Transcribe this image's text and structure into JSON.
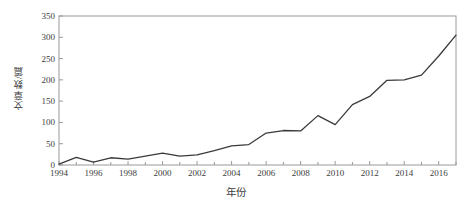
{
  "chart_data": {
    "type": "line",
    "title": "",
    "xlabel": "年份",
    "ylabel": "文章数/篇",
    "x": [
      1994,
      1995,
      1996,
      1997,
      1998,
      1999,
      2000,
      2001,
      2002,
      2003,
      2004,
      2005,
      2006,
      2007,
      2008,
      2009,
      2010,
      2011,
      2012,
      2013,
      2014,
      2015,
      2016,
      2017
    ],
    "values": [
      2,
      18,
      7,
      17,
      14,
      21,
      28,
      21,
      24,
      34,
      45,
      48,
      75,
      81,
      80,
      116,
      95,
      142,
      161,
      199,
      200,
      211,
      256,
      305
    ],
    "series": [
      {
        "name": "文章数",
        "values": [
          2,
          18,
          7,
          17,
          14,
          21,
          28,
          21,
          24,
          34,
          45,
          48,
          75,
          81,
          80,
          116,
          95,
          142,
          161,
          199,
          200,
          211,
          256,
          305
        ]
      }
    ],
    "xlim": [
      1994,
      2017
    ],
    "ylim": [
      0,
      350
    ],
    "yticks": [
      0,
      50,
      100,
      150,
      200,
      250,
      300,
      350
    ],
    "ytick_labels": [
      "0",
      "50",
      "100",
      "150",
      "200",
      "250",
      "300",
      "350"
    ],
    "xticks": [
      1994,
      1996,
      1998,
      2000,
      2002,
      2004,
      2006,
      2008,
      2010,
      2012,
      2014,
      2016
    ],
    "xtick_labels": [
      "1994",
      "1996",
      "1998",
      "2000",
      "2002",
      "2004",
      "2006",
      "2008",
      "2010",
      "2012",
      "2014",
      "2016"
    ],
    "x_minor_ticks": [
      1995,
      1997,
      1999,
      2001,
      2003,
      2005,
      2007,
      2009,
      2011,
      2013,
      2015,
      2017
    ],
    "grid": false,
    "legend": null,
    "line_color": "#3a3a3a",
    "line_width": 1.3,
    "frame_color": "#9a9a9a",
    "background_color": "#ffffff",
    "markers": false
  }
}
